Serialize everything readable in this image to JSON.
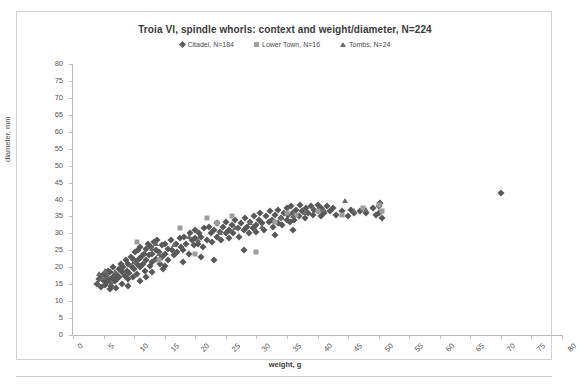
{
  "chart_data": {
    "type": "scatter",
    "title": "Troia VI, spindle whorls: context and weight/diameter, N=224",
    "xlabel": "weight, g",
    "ylabel": "diameter, mm",
    "xlim": [
      0,
      80
    ],
    "ylim": [
      0,
      80
    ],
    "xticks": [
      0,
      5,
      10,
      15,
      20,
      25,
      30,
      35,
      40,
      45,
      50,
      55,
      60,
      65,
      70,
      75,
      80
    ],
    "yticks": [
      0,
      5,
      10,
      15,
      20,
      25,
      30,
      35,
      40,
      45,
      50,
      55,
      60,
      65,
      70,
      75,
      80
    ],
    "grid": false,
    "legend_position": "top-center",
    "series": [
      {
        "name": "Citadel, N=184",
        "marker": "diamond",
        "color": "#585858",
        "points": [
          [
            4.0,
            15.0
          ],
          [
            4.2,
            16.5
          ],
          [
            4.5,
            14.2
          ],
          [
            4.6,
            17.5
          ],
          [
            5.0,
            16.0
          ],
          [
            5.0,
            18.0
          ],
          [
            5.2,
            14.8
          ],
          [
            5.5,
            17.0
          ],
          [
            5.6,
            15.5
          ],
          [
            5.8,
            19.0
          ],
          [
            6.0,
            16.2
          ],
          [
            6.0,
            18.5
          ],
          [
            6.2,
            14.5
          ],
          [
            6.5,
            17.2
          ],
          [
            6.6,
            20.0
          ],
          [
            6.8,
            15.8
          ],
          [
            7.0,
            18.0
          ],
          [
            7.2,
            16.5
          ],
          [
            7.5,
            19.5
          ],
          [
            7.6,
            17.0
          ],
          [
            7.8,
            21.0
          ],
          [
            8.0,
            18.5
          ],
          [
            8.0,
            15.2
          ],
          [
            8.2,
            20.0
          ],
          [
            8.5,
            17.5
          ],
          [
            8.6,
            22.0
          ],
          [
            8.8,
            19.0
          ],
          [
            9.0,
            16.5
          ],
          [
            9.0,
            21.0
          ],
          [
            9.2,
            18.2
          ],
          [
            9.5,
            23.0
          ],
          [
            9.6,
            20.0
          ],
          [
            9.8,
            17.0
          ],
          [
            10.0,
            22.0
          ],
          [
            10.0,
            19.5
          ],
          [
            10.2,
            24.5
          ],
          [
            10.4,
            21.0
          ],
          [
            10.5,
            18.0
          ],
          [
            10.6,
            25.0
          ],
          [
            10.8,
            22.5
          ],
          [
            11.0,
            20.0
          ],
          [
            11.0,
            26.0
          ],
          [
            11.2,
            23.0
          ],
          [
            11.5,
            21.0
          ],
          [
            11.6,
            24.0
          ],
          [
            11.8,
            19.0
          ],
          [
            12.0,
            25.5
          ],
          [
            12.0,
            22.0
          ],
          [
            12.2,
            27.0
          ],
          [
            12.5,
            23.5
          ],
          [
            12.6,
            20.5
          ],
          [
            12.8,
            26.0
          ],
          [
            13.0,
            24.0
          ],
          [
            13.0,
            21.5
          ],
          [
            13.2,
            27.5
          ],
          [
            13.5,
            25.0
          ],
          [
            13.6,
            22.5
          ],
          [
            13.8,
            28.0
          ],
          [
            14.0,
            24.5
          ],
          [
            14.2,
            21.0
          ],
          [
            14.5,
            26.5
          ],
          [
            14.6,
            23.0
          ],
          [
            14.8,
            19.5
          ],
          [
            15.0,
            27.0
          ],
          [
            15.0,
            24.0
          ],
          [
            15.5,
            25.5
          ],
          [
            15.6,
            22.0
          ],
          [
            16.0,
            28.0
          ],
          [
            16.2,
            25.0
          ],
          [
            16.5,
            23.5
          ],
          [
            16.8,
            27.0
          ],
          [
            17.0,
            24.5
          ],
          [
            17.5,
            28.5
          ],
          [
            17.6,
            26.0
          ],
          [
            18.0,
            25.0
          ],
          [
            18.2,
            29.0
          ],
          [
            18.5,
            27.0
          ],
          [
            19.0,
            24.0
          ],
          [
            19.2,
            30.0
          ],
          [
            19.5,
            28.0
          ],
          [
            19.8,
            26.5
          ],
          [
            20.0,
            31.0
          ],
          [
            20.0,
            28.5
          ],
          [
            20.5,
            27.0
          ],
          [
            20.6,
            30.0
          ],
          [
            21.0,
            29.0
          ],
          [
            21.2,
            26.0
          ],
          [
            21.5,
            31.5
          ],
          [
            22.0,
            28.0
          ],
          [
            22.2,
            32.0
          ],
          [
            22.5,
            30.0
          ],
          [
            22.8,
            27.5
          ],
          [
            23.0,
            31.0
          ],
          [
            23.5,
            29.0
          ],
          [
            23.6,
            33.0
          ],
          [
            24.0,
            30.5
          ],
          [
            24.2,
            28.0
          ],
          [
            24.5,
            32.0
          ],
          [
            25.0,
            30.0
          ],
          [
            25.0,
            33.5
          ],
          [
            25.5,
            31.0
          ],
          [
            25.6,
            28.5
          ],
          [
            26.0,
            32.5
          ],
          [
            26.2,
            30.0
          ],
          [
            26.5,
            34.0
          ],
          [
            27.0,
            31.5
          ],
          [
            27.2,
            29.0
          ],
          [
            27.5,
            33.0
          ],
          [
            28.0,
            31.0
          ],
          [
            28.2,
            34.5
          ],
          [
            28.5,
            32.0
          ],
          [
            28.8,
            30.0
          ],
          [
            29.0,
            33.5
          ],
          [
            29.5,
            31.5
          ],
          [
            29.6,
            35.0
          ],
          [
            30.0,
            32.5
          ],
          [
            30.0,
            30.5
          ],
          [
            30.5,
            34.0
          ],
          [
            30.6,
            36.0
          ],
          [
            31.0,
            33.0
          ],
          [
            31.2,
            31.0
          ],
          [
            31.5,
            35.0
          ],
          [
            32.0,
            33.5
          ],
          [
            32.2,
            36.5
          ],
          [
            32.5,
            34.0
          ],
          [
            32.8,
            32.0
          ],
          [
            33.0,
            35.5
          ],
          [
            33.5,
            33.0
          ],
          [
            33.6,
            37.0
          ],
          [
            34.0,
            34.5
          ],
          [
            34.2,
            32.5
          ],
          [
            34.5,
            36.0
          ],
          [
            35.0,
            34.0
          ],
          [
            35.0,
            37.5
          ],
          [
            35.2,
            35.5
          ],
          [
            35.5,
            33.5
          ],
          [
            35.6,
            38.0
          ],
          [
            36.0,
            36.0
          ],
          [
            36.2,
            34.0
          ],
          [
            36.5,
            37.0
          ],
          [
            37.0,
            35.0
          ],
          [
            37.2,
            38.5
          ],
          [
            37.5,
            36.5
          ],
          [
            38.0,
            34.5
          ],
          [
            38.2,
            37.5
          ],
          [
            38.5,
            36.0
          ],
          [
            39.0,
            38.0
          ],
          [
            39.2,
            35.5
          ],
          [
            39.5,
            37.0
          ],
          [
            40.0,
            36.5
          ],
          [
            40.0,
            38.5
          ],
          [
            40.5,
            35.0
          ],
          [
            40.6,
            37.5
          ],
          [
            41.0,
            36.0
          ],
          [
            41.5,
            38.0
          ],
          [
            42.0,
            36.5
          ],
          [
            42.5,
            37.5
          ],
          [
            43.0,
            35.5
          ],
          [
            44.0,
            36.5
          ],
          [
            45.0,
            35.0
          ],
          [
            45.5,
            37.0
          ],
          [
            46.0,
            36.0
          ],
          [
            47.0,
            36.5
          ],
          [
            48.0,
            36.0
          ],
          [
            49.0,
            37.5
          ],
          [
            49.5,
            35.5
          ],
          [
            50.0,
            38.0
          ],
          [
            50.0,
            36.0
          ],
          [
            50.2,
            39.0
          ],
          [
            50.5,
            34.5
          ],
          [
            23.0,
            22.0
          ],
          [
            28.0,
            25.0
          ],
          [
            12.0,
            17.0
          ],
          [
            15.0,
            20.5
          ],
          [
            18.0,
            21.5
          ],
          [
            21.0,
            23.0
          ],
          [
            33.0,
            29.5
          ],
          [
            36.0,
            31.0
          ],
          [
            6.0,
            13.5
          ],
          [
            7.0,
            14.0
          ],
          [
            9.0,
            14.5
          ],
          [
            11.0,
            16.0
          ],
          [
            13.0,
            18.5
          ],
          [
            70.0,
            42.0
          ]
        ]
      },
      {
        "name": "Lower Town, N=16",
        "marker": "square",
        "color": "#9d9d9d",
        "points": [
          [
            10.5,
            27.5
          ],
          [
            17.5,
            31.5
          ],
          [
            20.0,
            24.0
          ],
          [
            22.0,
            34.5
          ],
          [
            23.5,
            33.0
          ],
          [
            26.0,
            35.0
          ],
          [
            30.0,
            24.5
          ],
          [
            33.0,
            33.5
          ],
          [
            35.0,
            36.0
          ],
          [
            36.5,
            35.5
          ],
          [
            40.0,
            36.5
          ],
          [
            44.0,
            35.5
          ],
          [
            47.5,
            37.5
          ],
          [
            50.0,
            38.5
          ],
          [
            50.5,
            36.5
          ],
          [
            14.0,
            22.0
          ]
        ]
      },
      {
        "name": "Tombs, N=24",
        "marker": "triangle",
        "color": "#6b6b6b",
        "points": [
          [
            4.2,
            18.0
          ],
          [
            4.8,
            16.8
          ],
          [
            5.2,
            19.0
          ],
          [
            5.8,
            17.5
          ],
          [
            6.2,
            15.5
          ],
          [
            6.8,
            18.5
          ],
          [
            13.0,
            25.5
          ],
          [
            13.5,
            27.0
          ],
          [
            14.0,
            24.0
          ],
          [
            16.5,
            26.5
          ],
          [
            19.0,
            29.0
          ],
          [
            20.5,
            28.0
          ],
          [
            24.0,
            30.0
          ],
          [
            26.5,
            31.5
          ],
          [
            29.0,
            33.0
          ],
          [
            31.0,
            32.0
          ],
          [
            34.0,
            34.5
          ],
          [
            36.0,
            35.0
          ],
          [
            38.0,
            36.0
          ],
          [
            41.0,
            37.0
          ],
          [
            44.5,
            39.5
          ],
          [
            46.0,
            36.5
          ],
          [
            48.0,
            37.0
          ],
          [
            10.0,
            21.5
          ]
        ]
      }
    ]
  }
}
